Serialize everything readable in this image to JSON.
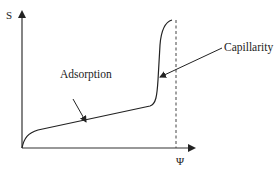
{
  "diagram": {
    "title": "",
    "y_axis": {
      "label": "S"
    },
    "x_axis": {
      "label": "Ψ"
    },
    "annotations": [
      {
        "id": "adsorption",
        "text": "Adsorption"
      },
      {
        "id": "capillarity",
        "text": "Capillarity"
      }
    ],
    "colors": {
      "line": "#222222",
      "background": "#ffffff"
    },
    "elements": [
      "y-axis-arrow",
      "x-axis-arrow",
      "dashed-vertical-limit-line",
      "isotherm-curve",
      "adsorption-arrow",
      "capillarity-arrow"
    ]
  }
}
